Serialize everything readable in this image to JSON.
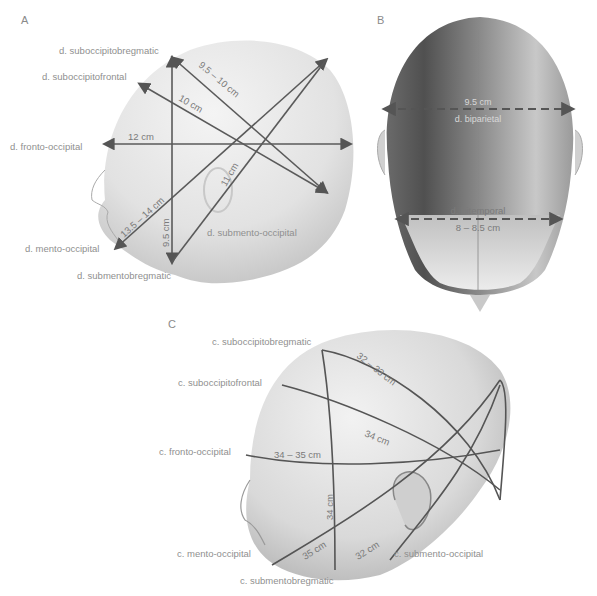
{
  "panels": {
    "A": {
      "letter": "A",
      "labels": {
        "suboccipitobregmatic": "d. suboccipitobregmatic",
        "suboccipitofrontal": "d. suboccipitofrontal",
        "fronto_occipital": "d. fronto-occipital",
        "mento_occipital": "d. mento-occipital",
        "submentobregmatic": "d. submentobregmatic",
        "submento_occipital": "d. submento-occipital"
      },
      "measurements": {
        "suboccipitobregmatic": "9.5 – 10 cm",
        "suboccipitofrontal": "10 cm",
        "fronto_occipital": "12 cm",
        "mento_occipital": "13.5 – 14 cm",
        "submentobregmatic": "9.5 cm",
        "submento_occipital": "11 cm"
      }
    },
    "B": {
      "letter": "B",
      "measurements": {
        "biparietal_value": "9.5 cm",
        "biparietal_label": "d. biparietal",
        "bitemporal_label": "d. bitemporal",
        "bitemporal_value": "8 – 8.5 cm"
      }
    },
    "C": {
      "letter": "C",
      "labels": {
        "suboccipitobregmatic": "c. suboccipitobregmatic",
        "suboccipitofrontal": "c. suboccipitofrontal",
        "fronto_occipital": "c. fronto-occipital",
        "mento_occipital": "c. mento-occipital",
        "submentobregmatic": "c. submentobregmatic",
        "submento_occipital": "c. submento-occipital"
      },
      "measurements": {
        "suboccipitobregmatic": "32 – 33 cm",
        "suboccipitofrontal": "34 cm",
        "fronto_occipital": "34 – 35 cm",
        "submentobregmatic": "34 cm",
        "mento_occipital": "35 cm",
        "submento_occipital": "32 cm"
      }
    }
  }
}
